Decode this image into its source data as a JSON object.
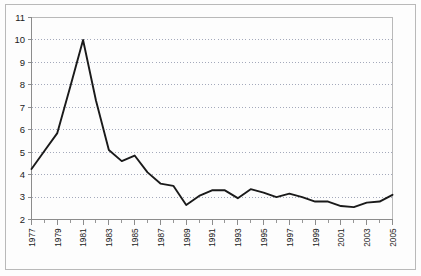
{
  "chart_data": {
    "type": "line",
    "title": "",
    "subtitle": "",
    "xlabel": "",
    "ylabel": "",
    "xlim": [
      1977,
      2005
    ],
    "ylim": [
      2,
      11
    ],
    "grid": true,
    "legend": null,
    "y_ticks": [
      2,
      3,
      4,
      5,
      6,
      7,
      8,
      9,
      10,
      11
    ],
    "x_ticks": [
      1977,
      1979,
      1981,
      1983,
      1985,
      1987,
      1989,
      1991,
      1993,
      1995,
      1997,
      1999,
      2001,
      2003,
      2005
    ],
    "x_tick_labels": [
      "1977",
      "1979",
      "1981",
      "1983",
      "1985",
      "1987",
      "1989",
      "1991",
      "1993",
      "1995",
      "1997",
      "1999",
      "2001",
      "2003",
      "2005"
    ],
    "x_minor_step": 1,
    "series": [
      {
        "name": "series-1",
        "color": "#1a1a1a",
        "x": [
          1977,
          1978,
          1979,
          1980,
          1981,
          1982,
          1983,
          1984,
          1985,
          1986,
          1987,
          1988,
          1989,
          1990,
          1991,
          1992,
          1993,
          1994,
          1995,
          1996,
          1997,
          1998,
          1999,
          2000,
          2001,
          2002,
          2003,
          2004,
          2005
        ],
        "values": [
          4.25,
          5.05,
          5.85,
          7.9,
          10.0,
          7.3,
          5.1,
          4.6,
          4.85,
          4.1,
          3.6,
          3.5,
          2.65,
          3.05,
          3.3,
          3.3,
          2.95,
          3.35,
          3.2,
          3.0,
          3.15,
          3.0,
          2.8,
          2.8,
          2.6,
          2.55,
          2.75,
          2.8,
          3.1
        ]
      }
    ],
    "colors": {
      "line": "#1a1a1a",
      "grid": "#9aa0b4",
      "axis": "#8c8c8c",
      "frame": "#b9b9b9",
      "background": "#fdfdfd",
      "text": "#1b1b1b"
    }
  }
}
